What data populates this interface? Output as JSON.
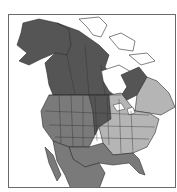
{
  "header": {
    "title": ""
  },
  "map": {
    "region": "North America",
    "colors": {
      "background": "#ffffff",
      "frame": "#6a6a6a",
      "dark_range": "#555555",
      "medium_range": "#7a7a7a",
      "light_range": "#b5b5b5",
      "unshaded_land": "#ffffff",
      "borders": "#2e2e2e"
    },
    "legend_hints": [
      {
        "shade": "dark",
        "meaning": "year-round / breeding"
      },
      {
        "shade": "medium",
        "meaning": "range"
      },
      {
        "shade": "light",
        "meaning": "range"
      }
    ]
  }
}
